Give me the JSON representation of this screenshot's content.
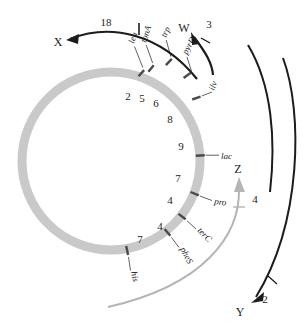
{
  "figure": {
    "map_type": "circular-genetic-map"
  },
  "chromosome": {
    "name": "chromosome-ring",
    "ring_color": "#c9c9c9",
    "tick_color": "#4a4a4a",
    "center_x": 111,
    "center_y": 161,
    "radius": 89,
    "ring_width": 9
  },
  "genes": [
    {
      "label": "leu",
      "angle": -72,
      "label_angle": -72,
      "leader": 22,
      "rot": -72,
      "anchor": "start"
    },
    {
      "label": "tonA",
      "angle": -64,
      "label_angle": -64,
      "leader": 22,
      "rot": -64,
      "anchor": "start"
    },
    {
      "label": "trp",
      "angle": -50,
      "label_angle": -50,
      "leader": 24,
      "rot": -50,
      "anchor": "start"
    },
    {
      "label": "pyrD",
      "angle": -35,
      "label_angle": -35,
      "leader": 26,
      "rot": -35,
      "anchor": "start"
    },
    {
      "label": "ilv",
      "angle": -19,
      "label_angle": -19,
      "leader": 18,
      "rot": -19,
      "anchor": "start"
    },
    {
      "label": "lac",
      "angle": 3,
      "label_angle": 3,
      "leader": 18,
      "rot": 0,
      "anchor": "start"
    },
    {
      "label": "pro",
      "angle": 22,
      "label_angle": 22,
      "leader": 20,
      "rot": 10,
      "anchor": "start"
    },
    {
      "label": "terC",
      "angle": 37,
      "label_angle": 37,
      "leader": 26,
      "rot": 37,
      "anchor": "start"
    },
    {
      "label": "pheS",
      "angle": 50,
      "label_angle": 50,
      "leader": 26,
      "rot": 50,
      "anchor": "start"
    },
    {
      "label": "his",
      "angle": 78,
      "label_angle": 78,
      "leader": 24,
      "rot": 78,
      "anchor": "start"
    }
  ],
  "intervals": [
    {
      "value": "2",
      "angle": -72,
      "radius": 70
    },
    {
      "value": "5",
      "angle": -64,
      "radius": 70
    },
    {
      "value": "6",
      "angle": -55,
      "radius": 69
    },
    {
      "value": "8",
      "angle": -40,
      "radius": 69
    },
    {
      "value": "9",
      "angle": -22,
      "radius": 68
    },
    {
      "value": "7",
      "angle": -2,
      "radius": 68
    },
    {
      "value": "4",
      "angle": 14,
      "radius": 68
    },
    {
      "value": "4",
      "angle": 28,
      "radius": 68
    },
    {
      "value": "7",
      "angle": 56,
      "radius": 70
    }
  ],
  "donors": [
    {
      "id": "donor-x",
      "label": "X",
      "value": "18",
      "color": "#1c1c1c",
      "label_x": 62,
      "label_y": 42,
      "value_x": 110,
      "value_y": 24,
      "arrowhead_x": 72,
      "arrowhead_y": 38
    },
    {
      "id": "donor-w",
      "label": "W",
      "value": "3",
      "color": "#1c1c1c",
      "label_x": 183,
      "label_y": 30,
      "value_x": 209,
      "value_y": 27,
      "arrowhead_x": 192,
      "arrowhead_y": 34
    },
    {
      "id": "donor-z",
      "label": "Z",
      "value": "4",
      "color": "#b3b3b3",
      "label_x": 237,
      "label_y": 180,
      "value_x": 254,
      "value_y": 204,
      "arrowhead_x": 241,
      "arrowhead_y": 185
    },
    {
      "id": "donor-y",
      "label": "Y",
      "value": "2",
      "color": "#1c1c1c",
      "label_x": 239,
      "label_y": 314,
      "value_x": 264,
      "value_y": 300,
      "arrowhead_x": 253,
      "arrowhead_y": 300
    }
  ],
  "arcs": {
    "outer_arc_1": "black-arc-upper-right",
    "outer_arc_2": "black-arc-far-right",
    "inner_arc_z": "gray-arc-lower",
    "inner_arc_x": "black-arc-top-left"
  }
}
